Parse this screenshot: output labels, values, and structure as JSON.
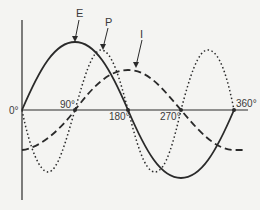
{
  "diagram": {
    "axis": {
      "x_labels": [
        "0°",
        "90°",
        "180°",
        "270°",
        "360°"
      ]
    },
    "curves": [
      {
        "id": "E",
        "label": "E",
        "style": "solid",
        "phase_deg": 0,
        "amplitude": 1.0,
        "meaning": "voltage"
      },
      {
        "id": "I",
        "label": "I",
        "style": "dashed",
        "phase_deg": -60,
        "amplitude": 0.6,
        "meaning": "current"
      },
      {
        "id": "P",
        "label": "P",
        "style": "dotted",
        "meaning": "power",
        "frequency_multiplier": 2
      }
    ],
    "colors": {
      "line": "#2a2a2a",
      "background": "#f4f4f2",
      "text": "#3a3a3a"
    }
  }
}
